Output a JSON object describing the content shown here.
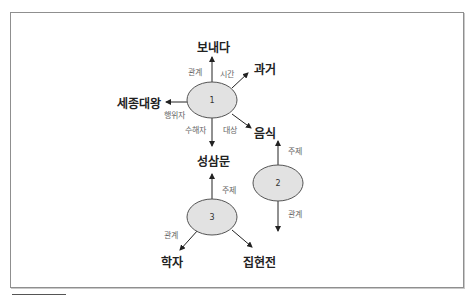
{
  "diagram": {
    "type": "semantic-network",
    "colors": {
      "ellipse_fill": "#e2e2e2",
      "ellipse_stroke": "#555555",
      "arrow": "#222222",
      "frame": "#8f8f8f"
    },
    "ellipses": [
      {
        "id": "1",
        "label": "1",
        "cx": 212,
        "cy": 100
      },
      {
        "id": "2",
        "label": "2",
        "cx": 278,
        "cy": 183
      },
      {
        "id": "3",
        "label": "3",
        "cx": 212,
        "cy": 217
      }
    ],
    "nodes": {
      "bonaeda": "보내다",
      "gwageo": "과거",
      "sejong": "세종대왕",
      "eumsik": "음식",
      "seongsammun": "성삼문",
      "hakja": "학자",
      "jiphyeonjeon": "집현전"
    },
    "edge_labels": {
      "e1_gwangye": "관계",
      "e1_sigan": "시간",
      "e1_haengwija": "행위자",
      "e1_suhaeja": "수해자",
      "e1_daesang": "대상",
      "e2_juje": "주제",
      "e2_gwangye": "관계",
      "e3_juje": "주제",
      "e3_gwangye": "관계"
    }
  }
}
